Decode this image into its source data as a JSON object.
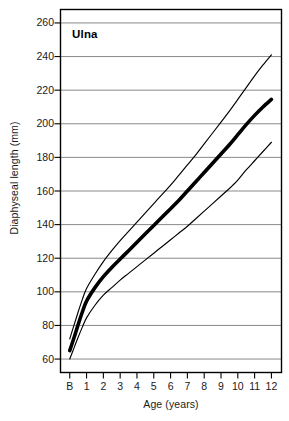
{
  "chart_data": {
    "type": "line",
    "title": "Ulna",
    "xlabel": "Age (years)",
    "ylabel": "Diaphyseal length (mm)",
    "xlim": [
      -0.55,
      12.6
    ],
    "ylim": [
      52,
      268
    ],
    "grid": true,
    "legend_position": "none",
    "x_tick_labels": [
      "B",
      "1",
      "2",
      "3",
      "4",
      "5",
      "6",
      "7",
      "8",
      "9",
      "10",
      "11",
      "12"
    ],
    "x_tick_values": [
      0,
      1,
      2,
      3,
      4,
      5,
      6,
      7,
      8,
      9,
      10,
      11,
      12
    ],
    "y_tick_labels": [
      "60",
      "80",
      "100",
      "120",
      "140",
      "160",
      "180",
      "200",
      "220",
      "240",
      "260"
    ],
    "y_tick_values": [
      60,
      80,
      100,
      120,
      140,
      160,
      180,
      200,
      220,
      240,
      260
    ],
    "x": [
      0,
      0.25,
      0.5,
      0.75,
      1,
      1.5,
      2,
      2.5,
      3,
      3.5,
      4,
      4.5,
      5,
      5.5,
      6,
      6.5,
      7,
      7.5,
      8,
      8.5,
      9,
      9.5,
      10,
      10.5,
      11,
      11.5,
      12
    ],
    "series": [
      {
        "name": "+2 SD (upper percentile)",
        "style": "thin",
        "color": "#000000",
        "values": [
          72,
          80,
          88,
          95.5,
          102,
          110.5,
          118,
          124.5,
          130.5,
          136,
          141.5,
          147,
          152.5,
          158,
          163.5,
          169.5,
          175.5,
          181.5,
          188,
          194.5,
          201,
          207.5,
          214.5,
          221.5,
          228.5,
          235,
          241
        ]
      },
      {
        "name": "Mean (median)",
        "style": "bold",
        "color": "#000000",
        "values": [
          65,
          72.5,
          80.5,
          88,
          94.5,
          102.5,
          109,
          114.5,
          119.5,
          124.5,
          129.5,
          134.5,
          139.5,
          144.5,
          149.5,
          154.5,
          160,
          165.5,
          171,
          176.5,
          182,
          187.5,
          193.5,
          199.5,
          205,
          210,
          214.5
        ]
      },
      {
        "name": "-2 SD (lower percentile)",
        "style": "thin",
        "color": "#000000",
        "values": [
          60,
          66.5,
          73,
          79,
          84.5,
          92,
          98,
          102.5,
          107,
          111,
          115,
          119,
          123,
          127,
          131,
          135,
          139,
          143.5,
          148,
          152.5,
          157,
          161.5,
          166.5,
          172.5,
          178,
          183.5,
          189
        ]
      }
    ]
  }
}
